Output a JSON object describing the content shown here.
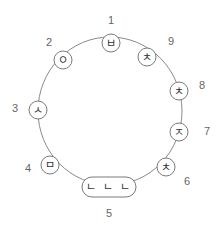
{
  "diagram": {
    "type": "circular-sequence",
    "ring": {
      "cx": 110,
      "cy": 111,
      "rx": 72,
      "ry": 74,
      "stroke": "#8a8a8a"
    },
    "nodes": [
      {
        "number": "1",
        "glyph": "ㅂ",
        "shape": "circle",
        "x": 111,
        "y": 43,
        "label_x": 111,
        "label_y": 20
      },
      {
        "number": "2",
        "glyph": "ㅇ",
        "shape": "circle",
        "x": 63,
        "y": 60,
        "label_x": 49,
        "label_y": 42
      },
      {
        "number": "3",
        "glyph": "ㅅ",
        "shape": "circle",
        "x": 38,
        "y": 110,
        "label_x": 15,
        "label_y": 108
      },
      {
        "number": "4",
        "glyph": "ㅁ",
        "shape": "circle",
        "x": 50,
        "y": 165,
        "label_x": 28,
        "label_y": 168
      },
      {
        "number": "5",
        "glyph": "ㄴ ㄴ ㄴ",
        "shape": "capsule",
        "x": 109,
        "y": 187,
        "label_x": 109,
        "label_y": 213
      },
      {
        "number": "6",
        "glyph": "ㅊ",
        "shape": "circle",
        "x": 166,
        "y": 167,
        "label_x": 187,
        "label_y": 181
      },
      {
        "number": "7",
        "glyph": "ㅈ",
        "shape": "circle",
        "x": 179,
        "y": 132,
        "label_x": 207,
        "label_y": 131
      },
      {
        "number": "8",
        "glyph": "ㅊ",
        "shape": "circle",
        "x": 179,
        "y": 91,
        "label_x": 202,
        "label_y": 85
      },
      {
        "number": "9",
        "glyph": "ㅊ",
        "shape": "circle",
        "x": 147,
        "y": 57,
        "label_x": 171,
        "label_y": 41
      }
    ]
  }
}
